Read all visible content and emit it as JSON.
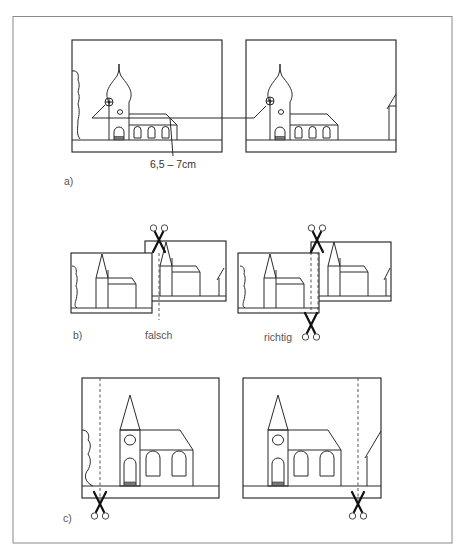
{
  "figure": {
    "panels": [
      {
        "id": "a",
        "label": "a)",
        "measurement_label": "6,5 – 7cm",
        "description": "Two overlapping photos of a church with onion dome; a connecting horizontal line links matching landmark (clock) in both photos"
      },
      {
        "id": "b",
        "label": "b)",
        "wrong_label": "falsch",
        "right_label": "richtig",
        "description": "Cutting overlapping photos: wrong cut through building vs. correct cut along edge of building"
      },
      {
        "id": "c",
        "label": "c)",
        "description": "Cut lines (dashed) marked on two photos with scissors indicating cut position"
      }
    ],
    "icons": [
      "scissors-icon",
      "clock-icon"
    ],
    "colors": {
      "line": "#2a2a2a",
      "label": "#555555",
      "frame_border": "#8a8a8a",
      "background": "#ffffff"
    }
  }
}
